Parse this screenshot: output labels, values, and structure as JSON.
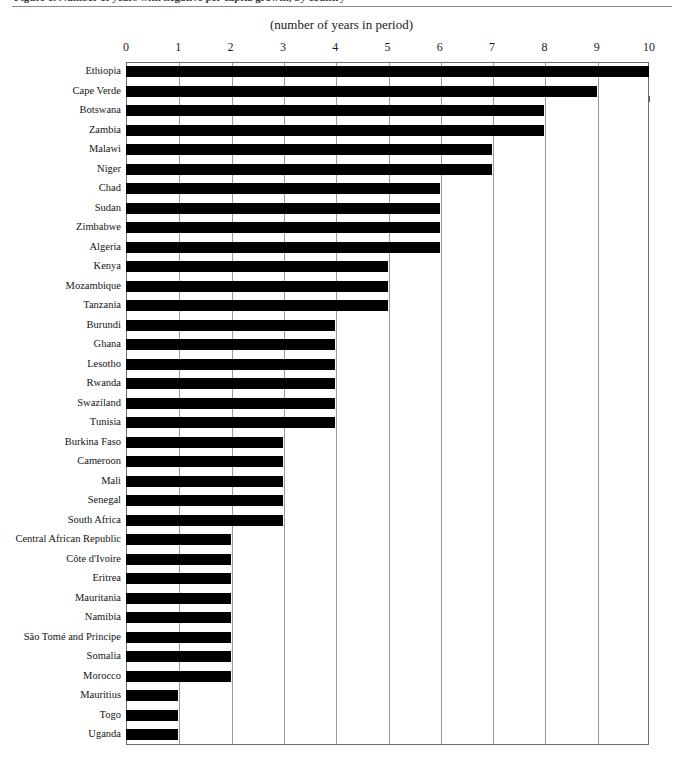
{
  "figure": {
    "clipped_caption": "Figure 1. Number of years with negative per capita growth, by country",
    "axis_title": "(number of years in period)"
  },
  "chart_data": {
    "type": "bar",
    "orientation": "horizontal",
    "title": "",
    "xlabel": "(number of years in period)",
    "ylabel": "",
    "xlim": [
      0,
      10
    ],
    "xticks": [
      0,
      1,
      2,
      3,
      4,
      5,
      6,
      7,
      8,
      9,
      10
    ],
    "xtick_labels": [
      "0",
      "1",
      "2",
      "3",
      "4",
      "5",
      "6",
      "7",
      "8",
      "9",
      "10"
    ],
    "grid": true,
    "grid_axis": "x",
    "legend": false,
    "bar_color": "#000000",
    "categories": [
      "Ethiopia",
      "Cape Verde",
      "Botswana",
      "Zambia",
      "Malawi",
      "Niger",
      "Chad",
      "Sudan",
      "Zimbabwe",
      "Algeria",
      "Kenya",
      "Mozambique",
      "Tanzania",
      "Burundi",
      "Ghana",
      "Lesotho",
      "Rwanda",
      "Swaziland",
      "Tunisia",
      "Burkina Faso",
      "Cameroon",
      "Mali",
      "Senegal",
      "South Africa",
      "Central African Republic",
      "Côte d'Ivoire",
      "Eritrea",
      "Mauritania",
      "Namibia",
      "São Tomé and Principe",
      "Somalia",
      "Morocco",
      "Mauritius",
      "Togo",
      "Uganda"
    ],
    "values": [
      10,
      9,
      8,
      8,
      7,
      7,
      6,
      6,
      6,
      6,
      5,
      5,
      5,
      4,
      4,
      4,
      4,
      4,
      4,
      3,
      3,
      3,
      3,
      3,
      2,
      2,
      2,
      2,
      2,
      2,
      2,
      2,
      1,
      1,
      1
    ]
  }
}
